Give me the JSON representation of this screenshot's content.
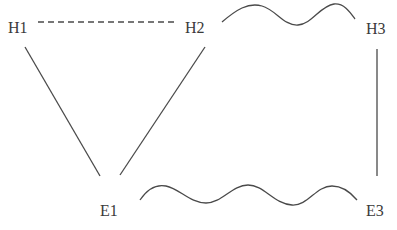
{
  "diagram": {
    "nodes": [
      {
        "id": "H1",
        "label": "H1",
        "x": 8,
        "y": 33
      },
      {
        "id": "H2",
        "label": "H2",
        "x": 185,
        "y": 33
      },
      {
        "id": "H3",
        "label": "H3",
        "x": 366,
        "y": 34
      },
      {
        "id": "E1",
        "label": "E1",
        "x": 100,
        "y": 216
      },
      {
        "id": "E3",
        "label": "E3",
        "x": 366,
        "y": 216
      }
    ],
    "edges": [
      {
        "from": "H1",
        "to": "H2",
        "style": "dashed"
      },
      {
        "from": "H2",
        "to": "H3",
        "style": "wavy"
      },
      {
        "from": "H1",
        "to": "E1",
        "style": "solid"
      },
      {
        "from": "H2",
        "to": "E1",
        "style": "solid"
      },
      {
        "from": "H3",
        "to": "E3",
        "style": "solid"
      },
      {
        "from": "E1",
        "to": "E3",
        "style": "wavy"
      }
    ],
    "colors": {
      "line": "#4a4a4a",
      "text": "#3a3a3a",
      "background": "#ffffff"
    }
  }
}
